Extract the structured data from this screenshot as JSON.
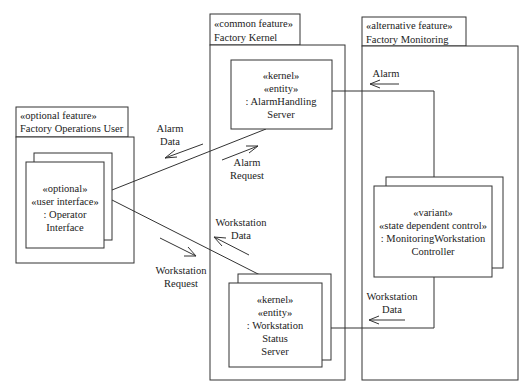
{
  "diagram": {
    "type": "UML communication diagram",
    "packages": [
      {
        "id": "factory-operations-user",
        "stereotype": "«optional feature»",
        "name": "Factory Operations User"
      },
      {
        "id": "factory-kernel",
        "stereotype": "«common feature»",
        "name": "Factory Kernel"
      },
      {
        "id": "factory-monitoring",
        "stereotype": "«alternative feature»",
        "name": "Factory Monitoring"
      }
    ],
    "objects": {
      "operator_interface": {
        "lines": [
          "«optional»",
          "«user interface»",
          ": Operator",
          "Interface"
        ],
        "multiple": true
      },
      "alarm_handling_server": {
        "lines": [
          "«kernel»",
          "«entity»",
          ": AlarmHandling",
          "Server"
        ],
        "multiple": false
      },
      "workstation_status_server": {
        "lines": [
          "«kernel»",
          "«entity»",
          ": Workstation",
          "Status",
          "Server"
        ],
        "multiple": true
      },
      "monitoring_workstation_controller": {
        "lines": [
          "«variant»",
          "«state dependent control»",
          ": MonitoringWorkstation",
          "Controller"
        ],
        "multiple": true
      }
    },
    "messages": {
      "alarm_data": [
        "Alarm",
        "Data"
      ],
      "alarm_request": [
        "Alarm",
        "Request"
      ],
      "workstation_data_left": [
        "Workstation",
        "Data"
      ],
      "workstation_request": [
        "Workstation",
        "Request"
      ],
      "alarm": [
        "Alarm"
      ],
      "workstation_data_right": [
        "Workstation",
        "Data"
      ]
    }
  }
}
